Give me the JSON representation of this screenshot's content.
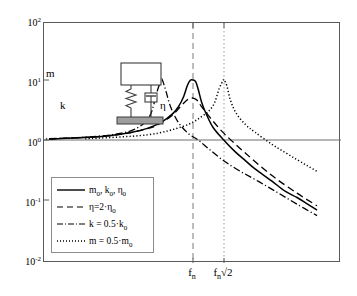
{
  "chart_data": {
    "type": "line",
    "title": "",
    "xlabel": "",
    "ylabel": "",
    "scale": {
      "x": "linear",
      "y": "log"
    },
    "ylim": [
      0.01,
      100
    ],
    "y_ticks": [
      "10^2",
      "10^1",
      "10^0",
      "10^-1",
      "10^-2"
    ],
    "y_tick_values": [
      100,
      10,
      1,
      0.1,
      0.01
    ],
    "x_ticks": [
      "f_n",
      "f_n√2"
    ],
    "x_tick_values": [
      1.0,
      1.4142
    ],
    "grid": false,
    "reference_lines": [
      {
        "name": "unity-line",
        "orientation": "horizontal",
        "value": 1,
        "style": "solid"
      },
      {
        "name": "fn-line",
        "orientation": "vertical",
        "value": 1.0,
        "style": "dashed"
      },
      {
        "name": "fn-sqrt2-line",
        "orientation": "vertical",
        "value": 1.4142,
        "style": "dotted"
      }
    ],
    "series": [
      {
        "name": "baseline",
        "label": "m0, k0, η0",
        "style": "solid",
        "peak_x": 1.0,
        "peak_y": 10,
        "x": [
          0.05,
          0.1,
          0.2,
          0.3,
          0.4,
          0.5,
          0.6,
          0.7,
          0.8,
          0.85,
          0.9,
          0.94,
          0.97,
          1.0,
          1.03,
          1.06,
          1.1,
          1.15,
          1.25,
          1.41,
          1.6,
          1.8,
          2.0,
          2.4,
          2.8,
          3.2,
          3.6,
          4.0
        ],
        "y": [
          1.0,
          1.01,
          1.04,
          1.1,
          1.19,
          1.33,
          1.56,
          1.96,
          2.78,
          3.6,
          5.26,
          8.2,
          9.9,
          10.0,
          9.4,
          7.0,
          4.3,
          2.9,
          1.63,
          1.0,
          0.64,
          0.45,
          0.33,
          0.21,
          0.14,
          0.11,
          0.085,
          0.068
        ]
      },
      {
        "name": "high-damping",
        "label": "η=2·η0",
        "style": "dashed",
        "peak_x": 1.0,
        "peak_y": 5,
        "x": [
          0.05,
          0.2,
          0.4,
          0.6,
          0.7,
          0.8,
          0.9,
          0.95,
          1.0,
          1.05,
          1.1,
          1.2,
          1.41,
          1.8,
          2.4,
          3.2,
          4.0
        ],
        "y": [
          1.0,
          1.04,
          1.19,
          1.55,
          1.92,
          2.65,
          4.1,
          4.8,
          5.0,
          4.55,
          3.6,
          2.45,
          1.3,
          0.6,
          0.26,
          0.13,
          0.08
        ]
      },
      {
        "name": "soft-spring",
        "label": "k = 0.5·k0",
        "style": "dashdot",
        "peak_x": 0.707,
        "peak_y": 10,
        "x": [
          0.05,
          0.15,
          0.3,
          0.45,
          0.55,
          0.62,
          0.67,
          0.7,
          0.71,
          0.74,
          0.78,
          0.85,
          0.95,
          1.06,
          1.2,
          1.41,
          1.7,
          2.1,
          2.6,
          3.2,
          4.0
        ],
        "y": [
          1.0,
          1.02,
          1.11,
          1.3,
          1.67,
          2.6,
          6.5,
          9.8,
          10.0,
          6.4,
          3.5,
          1.95,
          1.28,
          1.0,
          0.7,
          0.45,
          0.3,
          0.2,
          0.13,
          0.085,
          0.055
        ]
      },
      {
        "name": "light-mass",
        "label": "m = 0.5·m0",
        "style": "dotted",
        "peak_x": 1.4142,
        "peak_y": 10,
        "x": [
          0.05,
          0.3,
          0.6,
          0.9,
          1.1,
          1.25,
          1.34,
          1.4,
          1.4142,
          1.46,
          1.52,
          1.62,
          1.8,
          2.0,
          2.4,
          2.8,
          3.2,
          3.6,
          4.0
        ],
        "y": [
          1.0,
          1.05,
          1.22,
          1.7,
          2.45,
          3.7,
          7.2,
          9.8,
          10.0,
          8.0,
          4.6,
          2.8,
          1.8,
          1.35,
          0.86,
          0.62,
          0.47,
          0.37,
          0.3
        ]
      }
    ]
  },
  "y_axis": {
    "ticks": [
      {
        "mantissa": "10",
        "exponent": "2"
      },
      {
        "mantissa": "10",
        "exponent": "1"
      },
      {
        "mantissa": "10",
        "exponent": "0"
      },
      {
        "mantissa": "10",
        "exponent": "-1"
      },
      {
        "mantissa": "10",
        "exponent": "-2"
      }
    ]
  },
  "x_axis": {
    "ticks": [
      {
        "base": "f",
        "sub": "n",
        "suffix": ""
      },
      {
        "base": "f",
        "sub": "n",
        "suffix": "√2"
      }
    ]
  },
  "legend": {
    "entries": [
      {
        "style": "solid",
        "base": "m",
        "sub1": "0",
        "mid": ", k",
        "sub2": "0",
        "mid2": ", η",
        "sub3": "0"
      },
      {
        "style": "dashed",
        "text_pre": "η=2·η",
        "text_sub": "0"
      },
      {
        "style": "dashdot",
        "text_pre": "k = 0.5·k",
        "text_sub": "0"
      },
      {
        "style": "dotted",
        "text_pre": "m = 0.5·m",
        "text_sub": "0"
      }
    ]
  },
  "inset": {
    "mass_label": "m",
    "spring_label": "k",
    "damper_label": "η"
  },
  "colors": {
    "axis": "#5a5a5a",
    "curve": "#000000",
    "reference": "#7a7a7a",
    "ground": "#999999",
    "background": "#ffffff"
  }
}
